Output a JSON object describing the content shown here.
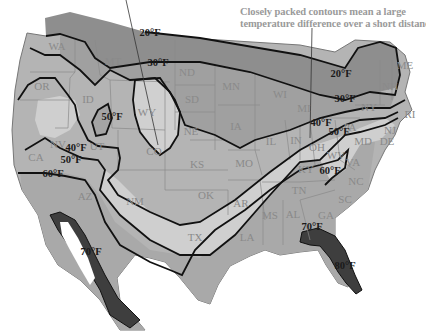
{
  "caption": {
    "line1": "Closely packed contours mean a large",
    "line2": "temperature difference over a short distance."
  },
  "colors": {
    "cold_20": "#8e8e8e",
    "zone_30_40": "#a8a8a8",
    "zone_40_50": "#b4b4b4",
    "zone_50_60": "#cfcfcf",
    "zone_60_70": "#a9a9a9",
    "hot_70": "#3e3e3e",
    "light_pockets": "#d6d6d6",
    "contour": "#111111",
    "state_border": "#8a8a8a",
    "caption_text": "#9a9a9a",
    "state_label": "#8a8a8a"
  },
  "isotherm_labels": [
    {
      "text": "20°F",
      "x": 150,
      "y": 32
    },
    {
      "text": "30°F",
      "x": 158,
      "y": 62
    },
    {
      "text": "50°F",
      "x": 112,
      "y": 116
    },
    {
      "text": "40°F",
      "x": 76,
      "y": 147
    },
    {
      "text": "50°F",
      "x": 71,
      "y": 159
    },
    {
      "text": "60°F",
      "x": 53,
      "y": 173
    },
    {
      "text": "20°F",
      "x": 341,
      "y": 73
    },
    {
      "text": "30°F",
      "x": 345,
      "y": 98
    },
    {
      "text": "40°F",
      "x": 321,
      "y": 122
    },
    {
      "text": "50°F",
      "x": 339,
      "y": 131
    },
    {
      "text": "60°F",
      "x": 330,
      "y": 170
    },
    {
      "text": "70°F",
      "x": 91,
      "y": 251
    },
    {
      "text": "70°F",
      "x": 312,
      "y": 226
    },
    {
      "text": "80°F",
      "x": 345,
      "y": 265
    }
  ],
  "states": [
    {
      "abbr": "WA",
      "x": 57,
      "y": 46
    },
    {
      "abbr": "OR",
      "x": 42,
      "y": 86
    },
    {
      "abbr": "CA",
      "x": 36,
      "y": 157
    },
    {
      "abbr": "NV",
      "x": 58,
      "y": 144
    },
    {
      "abbr": "ID",
      "x": 88,
      "y": 99
    },
    {
      "abbr": "MT",
      "x": 113,
      "y": 61
    },
    {
      "abbr": "WY",
      "x": 147,
      "y": 112
    },
    {
      "abbr": "UT",
      "x": 97,
      "y": 146
    },
    {
      "abbr": "CO",
      "x": 154,
      "y": 151
    },
    {
      "abbr": "AZ",
      "x": 85,
      "y": 196
    },
    {
      "abbr": "NM",
      "x": 135,
      "y": 201
    },
    {
      "abbr": "ND",
      "x": 187,
      "y": 72
    },
    {
      "abbr": "SD",
      "x": 192,
      "y": 99
    },
    {
      "abbr": "NE",
      "x": 191,
      "y": 131
    },
    {
      "abbr": "KS",
      "x": 197,
      "y": 164
    },
    {
      "abbr": "OK",
      "x": 206,
      "y": 195
    },
    {
      "abbr": "TX",
      "x": 195,
      "y": 237
    },
    {
      "abbr": "MN",
      "x": 231,
      "y": 86
    },
    {
      "abbr": "IA",
      "x": 236,
      "y": 126
    },
    {
      "abbr": "MO",
      "x": 244,
      "y": 163
    },
    {
      "abbr": "AR",
      "x": 241,
      "y": 203
    },
    {
      "abbr": "LA",
      "x": 247,
      "y": 237
    },
    {
      "abbr": "WI",
      "x": 280,
      "y": 94
    },
    {
      "abbr": "IL",
      "x": 271,
      "y": 141
    },
    {
      "abbr": "MI",
      "x": 304,
      "y": 108
    },
    {
      "abbr": "IN",
      "x": 296,
      "y": 140
    },
    {
      "abbr": "OH",
      "x": 317,
      "y": 147
    },
    {
      "abbr": "KY",
      "x": 306,
      "y": 169
    },
    {
      "abbr": "TN",
      "x": 299,
      "y": 190
    },
    {
      "abbr": "MS",
      "x": 270,
      "y": 215
    },
    {
      "abbr": "AL",
      "x": 293,
      "y": 214
    },
    {
      "abbr": "GA",
      "x": 326,
      "y": 215
    },
    {
      "abbr": "SC",
      "x": 345,
      "y": 199
    },
    {
      "abbr": "NC",
      "x": 356,
      "y": 181
    },
    {
      "abbr": "VA",
      "x": 353,
      "y": 162
    },
    {
      "abbr": "WV",
      "x": 336,
      "y": 155
    },
    {
      "abbr": "PA",
      "x": 350,
      "y": 127
    },
    {
      "abbr": "NY",
      "x": 369,
      "y": 107
    },
    {
      "abbr": "NJ",
      "x": 390,
      "y": 130
    },
    {
      "abbr": "MD",
      "x": 363,
      "y": 141
    },
    {
      "abbr": "DE",
      "x": 387,
      "y": 141
    },
    {
      "abbr": "RI",
      "x": 410,
      "y": 114
    },
    {
      "abbr": "NH",
      "x": 390,
      "y": 86
    },
    {
      "abbr": "ME",
      "x": 405,
      "y": 65
    }
  ]
}
